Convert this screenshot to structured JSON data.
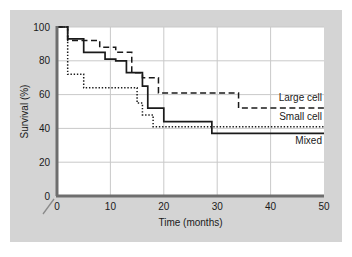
{
  "figure": {
    "background_color": "#d4d4d4",
    "plot_background_color": "#ffffff",
    "axis_color": "#6e6e6e",
    "grid_color": "#c9c9c9",
    "line_color": "#1a1a1a",
    "axis_break_symbol": "/"
  },
  "chart_data": {
    "type": "line",
    "title": "",
    "xlabel": "Time (months)",
    "ylabel": "Survival (%)",
    "xlim": [
      0,
      50
    ],
    "ylim": [
      0,
      100
    ],
    "xticks": [
      0,
      10,
      20,
      30,
      40,
      50
    ],
    "yticks": [
      0,
      20,
      40,
      60,
      80,
      100
    ],
    "grid": true,
    "legend_position": "right-inline",
    "step_type": "post",
    "series": [
      {
        "name": "Large cell",
        "style": "dashed",
        "x": [
          0,
          2,
          5,
          8,
          11,
          14,
          16,
          19,
          34,
          50
        ],
        "y": [
          100,
          92,
          92,
          88,
          85,
          73,
          70,
          61,
          52,
          52
        ]
      },
      {
        "name": "Small cell",
        "style": "dotted",
        "x": [
          0,
          2,
          4,
          5,
          14,
          15,
          16,
          18,
          50
        ],
        "y": [
          100,
          72,
          72,
          64,
          64,
          55,
          48,
          41,
          41
        ]
      },
      {
        "name": "Mixed",
        "style": "solid",
        "x": [
          0,
          2,
          5,
          9,
          11,
          13,
          16,
          17,
          20,
          29,
          50
        ],
        "y": [
          100,
          93,
          85,
          81,
          80,
          73,
          65,
          52,
          44,
          37,
          37
        ]
      }
    ]
  },
  "legend": {
    "items": [
      {
        "label": "Large cell",
        "style": "dashed"
      },
      {
        "label": "Small cell",
        "style": "dotted"
      },
      {
        "label": "Mixed",
        "style": "solid"
      }
    ]
  }
}
